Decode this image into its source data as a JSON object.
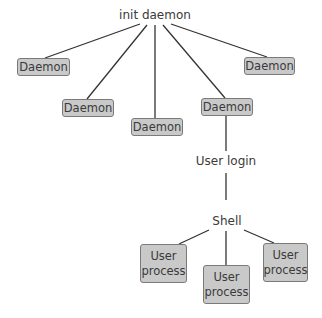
{
  "diagram": {
    "root": {
      "label": "init daemon"
    },
    "daemons": [
      {
        "label": "Daemon"
      },
      {
        "label": "Daemon"
      },
      {
        "label": "Daemon"
      },
      {
        "label": "Daemon"
      },
      {
        "label": "Daemon"
      }
    ],
    "user_login": {
      "label": "User login"
    },
    "shell": {
      "label": "Shell"
    },
    "user_processes": [
      {
        "label": "User process"
      },
      {
        "label": "User process"
      },
      {
        "label": "User process"
      }
    ],
    "colors": {
      "box_fill": "#c9c9c9",
      "box_border": "#7a7a7a",
      "line": "#333333",
      "text": "#3a3a3a"
    }
  }
}
